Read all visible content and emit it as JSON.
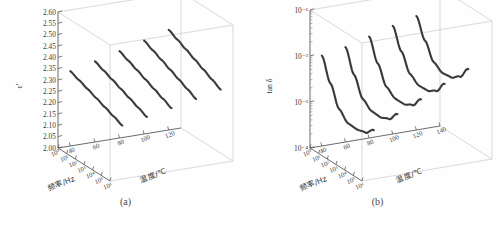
{
  "figure": {
    "panels": [
      {
        "id": "a",
        "caption": "(a)",
        "zlabel": "ε′",
        "xlabel": "频率/Hz",
        "ylabel": "温度/℃",
        "chart_data": {
          "type": "line",
          "projection": "3d",
          "title": "",
          "xlabel": "频率/Hz",
          "ylabel": "温度/℃",
          "zlabel": "ε′",
          "grid": false,
          "legend": "none",
          "x_scale": "log",
          "z_scale": "linear",
          "xlim": [
            1,
            1000000
          ],
          "ylim": [
            30,
            130
          ],
          "zlim": [
            2.0,
            2.6
          ],
          "x_ticks": [
            "10⁰",
            "10¹",
            "10²",
            "10³",
            "10⁴",
            "10⁵",
            "10⁶"
          ],
          "x_tick_values": [
            1,
            10,
            100,
            1000,
            10000,
            100000,
            1000000
          ],
          "y_ticks": [
            "40",
            "60",
            "80",
            "100",
            "120"
          ],
          "y_tick_values": [
            40,
            60,
            80,
            100,
            120
          ],
          "z_ticks": [
            "2.00",
            "2.05",
            "2.10",
            "2.15",
            "2.20",
            "2.25",
            "2.30",
            "2.35",
            "2.40",
            "2.45",
            "2.50",
            "2.55",
            "2.60"
          ],
          "z_tick_values": [
            2.0,
            2.05,
            2.1,
            2.15,
            2.2,
            2.25,
            2.3,
            2.35,
            2.4,
            2.45,
            2.5,
            2.55,
            2.6
          ],
          "x": [
            1,
            10,
            100,
            1000,
            10000,
            100000,
            1000000
          ],
          "series": [
            {
              "name": "40 ℃",
              "temperature": 40,
              "values": [
                2.33,
                2.315,
                2.3,
                2.284,
                2.268,
                2.252,
                2.236
              ]
            },
            {
              "name": "60 ℃",
              "temperature": 60,
              "values": [
                2.356,
                2.34,
                2.324,
                2.307,
                2.29,
                2.273,
                2.256
              ]
            },
            {
              "name": "80 ℃",
              "temperature": 80,
              "values": [
                2.383,
                2.366,
                2.349,
                2.331,
                2.313,
                2.295,
                2.277
              ]
            },
            {
              "name": "100 ℃",
              "temperature": 100,
              "values": [
                2.412,
                2.394,
                2.376,
                2.357,
                2.338,
                2.319,
                2.3
              ]
            },
            {
              "name": "120 ℃",
              "temperature": 120,
              "values": [
                2.442,
                2.423,
                2.404,
                2.384,
                2.364,
                2.344,
                2.324
              ]
            }
          ]
        }
      },
      {
        "id": "b",
        "caption": "(b)",
        "zlabel": "tan δ",
        "xlabel": "频率/Hz",
        "ylabel": "温度/℃",
        "chart_data": {
          "type": "line",
          "projection": "3d",
          "title": "",
          "xlabel": "频率/Hz",
          "ylabel": "温度/℃",
          "zlabel": "tan δ",
          "grid": false,
          "legend": "none",
          "x_scale": "log",
          "z_scale": "log",
          "xlim": [
            1,
            1000000
          ],
          "ylim": [
            30,
            140
          ],
          "zlim": [
            0.0001,
            0.1
          ],
          "x_ticks": [
            "10⁰",
            "10¹",
            "10²",
            "10³",
            "10⁴",
            "10⁵",
            "10⁶"
          ],
          "x_tick_values": [
            1,
            10,
            100,
            1000,
            10000,
            100000,
            1000000
          ],
          "y_ticks": [
            "40",
            "60",
            "80",
            "100",
            "120",
            "140"
          ],
          "y_tick_values": [
            40,
            60,
            80,
            100,
            120,
            140
          ],
          "z_ticks": [
            "10⁻¹",
            "10⁻²",
            "10⁻³",
            "10⁻⁴"
          ],
          "z_tick_values": [
            0.1,
            0.01,
            0.001,
            0.0001
          ],
          "x": [
            1,
            10,
            100,
            1000,
            10000,
            100000,
            1000000
          ],
          "series": [
            {
              "name": "40 ℃",
              "temperature": 40,
              "values": [
                0.0092,
                0.003,
                0.0011,
                0.00072,
                0.0007,
                0.00078,
                0.00115
              ]
            },
            {
              "name": "60 ℃",
              "temperature": 60,
              "values": [
                0.0115,
                0.0038,
                0.0015,
                0.00108,
                0.00105,
                0.00125,
                0.0021
              ]
            },
            {
              "name": "80 ℃",
              "temperature": 80,
              "values": [
                0.016,
                0.0055,
                0.00225,
                0.00165,
                0.00165,
                0.00205,
                0.0036
              ]
            },
            {
              "name": "100 ℃",
              "temperature": 100,
              "values": [
                0.0225,
                0.0082,
                0.0035,
                0.0026,
                0.00265,
                0.0034,
                0.0064
              ]
            },
            {
              "name": "120 ℃",
              "temperature": 120,
              "values": [
                0.03,
                0.0115,
                0.0052,
                0.004,
                0.0042,
                0.0057,
                0.011
              ]
            }
          ]
        }
      }
    ]
  }
}
